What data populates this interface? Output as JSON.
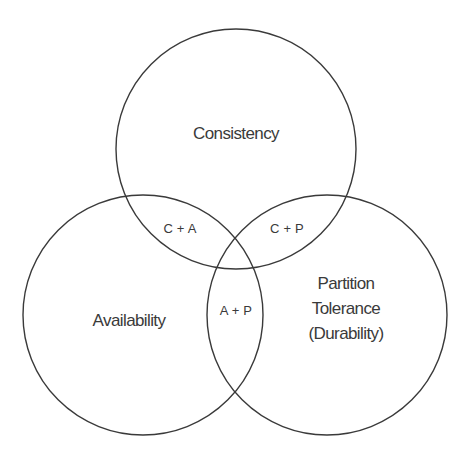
{
  "diagram": {
    "type": "venn",
    "stroke_color": "#3a3a3a",
    "background": "#ffffff",
    "sets": [
      {
        "id": "C",
        "label": "Consistency",
        "cx": 236,
        "cy": 149,
        "r": 120
      },
      {
        "id": "A",
        "label": "Availability",
        "cx": 143,
        "cy": 315,
        "r": 120
      },
      {
        "id": "P",
        "label_lines": [
          "Partition",
          "Tolerance",
          "(Durability)"
        ],
        "cx": 327,
        "cy": 315,
        "r": 120
      }
    ],
    "overlaps": [
      {
        "sets": [
          "C",
          "A"
        ],
        "label": "C + A"
      },
      {
        "sets": [
          "C",
          "P"
        ],
        "label": "C + P"
      },
      {
        "sets": [
          "A",
          "P"
        ],
        "label": "A + P"
      }
    ]
  }
}
